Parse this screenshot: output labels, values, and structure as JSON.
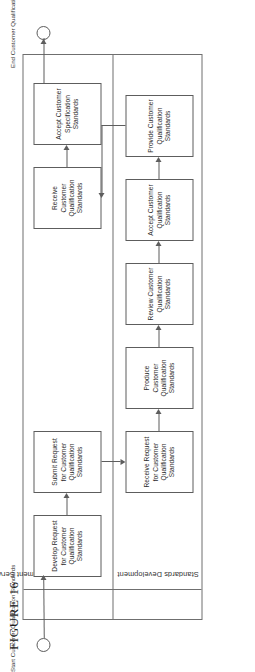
{
  "figure": {
    "caption": "FIGURE 16",
    "type": "swimlane-flowchart"
  },
  "lanes": [
    {
      "id": "order-management-service-owner",
      "label": "Order Management Service Owner"
    },
    {
      "id": "standards-development",
      "label": "Standards Development"
    }
  ],
  "terminators": [
    {
      "id": "start",
      "kind": "start-circle",
      "label": "Start Customer Qualification Standards"
    },
    {
      "id": "end",
      "kind": "end-circle",
      "label": "End Customer Qualification Standards"
    }
  ],
  "nodes": [
    {
      "id": "develop-request",
      "lane": "order-management-service-owner",
      "label": "Develop Request for Customer Qualification Standards"
    },
    {
      "id": "submit-request",
      "lane": "order-management-service-owner",
      "label": "Submit Request for Customer Qualification Standards"
    },
    {
      "id": "receive-request",
      "lane": "standards-development",
      "label": "Receive Request for Customer Qualification Standards"
    },
    {
      "id": "produce-standards",
      "lane": "standards-development",
      "label": "Produce Customer Qualification Standards"
    },
    {
      "id": "review-standards",
      "lane": "standards-development",
      "label": "Review  Customer Qualification Standards"
    },
    {
      "id": "accept-standards-dev",
      "lane": "standards-development",
      "label": "Accept Customer Qualification Standards"
    },
    {
      "id": "provide-standards",
      "lane": "standards-development",
      "label": "Provide Customer Qualification Standards"
    },
    {
      "id": "receive-standards",
      "lane": "order-management-service-owner",
      "label": "Receive Customer Qualification Standards"
    },
    {
      "id": "accept-specification",
      "lane": "order-management-service-owner",
      "label": "Accept Customer Specification Standards"
    }
  ],
  "edges": [
    {
      "from": "start",
      "to": "develop-request"
    },
    {
      "from": "develop-request",
      "to": "submit-request"
    },
    {
      "from": "submit-request",
      "to": "receive-request"
    },
    {
      "from": "receive-request",
      "to": "produce-standards"
    },
    {
      "from": "produce-standards",
      "to": "review-standards"
    },
    {
      "from": "review-standards",
      "to": "accept-standards-dev"
    },
    {
      "from": "accept-standards-dev",
      "to": "provide-standards"
    },
    {
      "from": "provide-standards",
      "to": "receive-standards"
    },
    {
      "from": "receive-standards",
      "to": "accept-specification"
    },
    {
      "from": "accept-specification",
      "to": "end"
    }
  ],
  "colors": {
    "line": "#5d5d5d",
    "frame": "#6f6f6f",
    "text": "#2b2b2b",
    "background": "#ffffff"
  }
}
